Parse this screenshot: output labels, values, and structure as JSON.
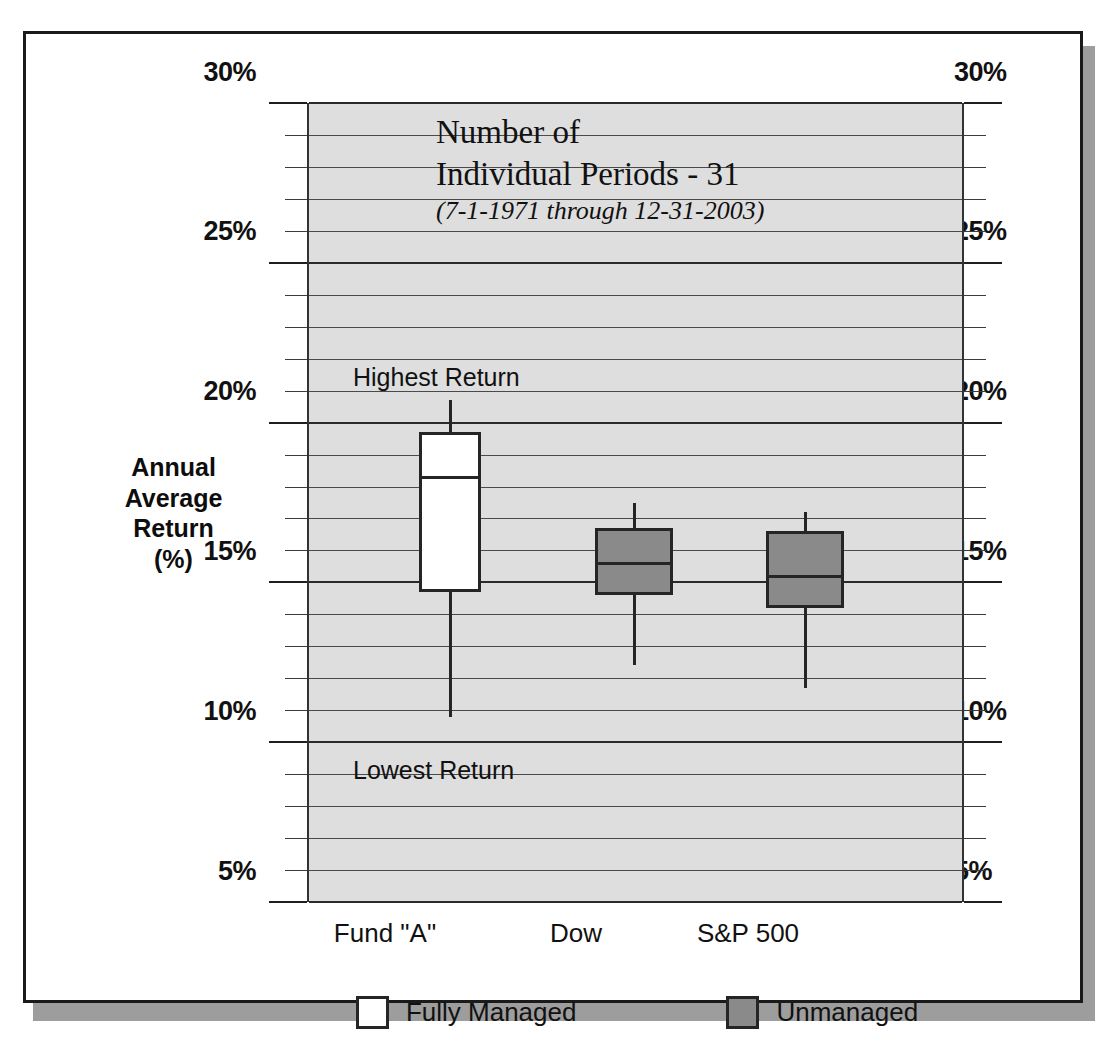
{
  "chart_data": {
    "type": "box",
    "title": "Number of Individual Periods - 31",
    "title_line1": "Number of",
    "title_line2": "Individual Periods - 31",
    "subtitle": "(7-1-1971 through 12-31-2003)",
    "ylabel": "Annual\nAverage\nReturn\n(%)",
    "ylabel_lines": [
      "Annual",
      "Average",
      "Return",
      "(%)"
    ],
    "xlabel": "",
    "ylim": [
      5,
      30
    ],
    "ytick_labels": [
      "30%",
      "25%",
      "20%",
      "15%",
      "10%",
      "5%"
    ],
    "ytick_values": [
      30,
      25,
      20,
      15,
      10,
      5
    ],
    "minor_tick_step": 1,
    "grid": true,
    "dual_y_axis": true,
    "categories": [
      "Fund \"A\"",
      "Dow",
      "S&P 500"
    ],
    "annotations": [
      {
        "text": "Highest Return",
        "value": 21.4
      },
      {
        "text": "Lowest Return",
        "value": 9.1
      }
    ],
    "boxes": [
      {
        "category": "Fund \"A\"",
        "group": "Fully Managed",
        "high": 20.7,
        "q3": 19.7,
        "median": 18.3,
        "q1": 14.7,
        "low": 10.8
      },
      {
        "category": "Dow",
        "group": "Unmanaged",
        "high": 17.5,
        "q3": 16.7,
        "median": 15.6,
        "q1": 14.6,
        "low": 12.4
      },
      {
        "category": "S&P 500",
        "group": "Unmanaged",
        "high": 17.2,
        "q3": 16.6,
        "median": 15.2,
        "q1": 14.2,
        "low": 11.7
      }
    ],
    "legend": [
      {
        "label": "Fully Managed",
        "swatch": "white"
      },
      {
        "label": "Unmanaged",
        "swatch": "gray"
      }
    ],
    "legend_position": "bottom",
    "colors": {
      "managed_fill": "#ffffff",
      "unmanaged_fill": "#8a8a8a",
      "plot_background": "#dedede",
      "line": "#252525",
      "frame": "#1a1a1a",
      "shadow": "#9d9d9d"
    }
  },
  "yticks": {
    "t30": "30%",
    "t25": "25%",
    "t20": "20%",
    "t15": "15%",
    "t10": "10%",
    "t5": "5%"
  },
  "xticks": {
    "c0": "Fund \"A\"",
    "c1": "Dow",
    "c2": "S&P 500"
  },
  "ylabel": {
    "l0": "Annual",
    "l1": "Average",
    "l2": "Return",
    "l3": "(%)"
  },
  "title": {
    "line1": "Number of",
    "line2": "Individual Periods - 31",
    "subtitle": "(7-1-1971 through 12-31-2003)"
  },
  "annotations": {
    "highest": "Highest Return",
    "lowest": "Lowest Return"
  },
  "legend": {
    "managed": "Fully Managed",
    "unmanaged": "Unmanaged"
  }
}
